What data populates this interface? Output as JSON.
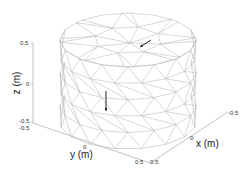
{
  "chart_data": {
    "type": "3d-mesh",
    "title": "",
    "xlabel": "x (m)",
    "ylabel": "y (m)",
    "zlabel": "z (m)",
    "xlim": [
      -0.5,
      0.5
    ],
    "ylim": [
      -0.5,
      0.5
    ],
    "zlim": [
      -0.5,
      0.5
    ],
    "xticks": [
      "0.5",
      "0",
      "-0.5"
    ],
    "yticks": [
      "-0.5",
      "0",
      "0.5"
    ],
    "zticks": [
      "0.5",
      "0",
      "-0.5"
    ],
    "grid": false,
    "legend": null,
    "mesh": {
      "shape": "cylinder",
      "radius": 0.5,
      "z_range": [
        -0.5,
        0.5
      ],
      "angular_divisions": 16,
      "height_divisions": 5,
      "edge_color": "#b8b8b8",
      "face_color": "#ffffff"
    },
    "arrows": [
      {
        "location": "top-face",
        "direction": "down-left (in-plane)",
        "color": "#222222"
      },
      {
        "location": "side-face",
        "direction": "down (-z)",
        "color": "#222222"
      }
    ]
  },
  "axes": {
    "x": {
      "label": "x (m)",
      "ticks": [
        {
          "text": "0.5"
        },
        {
          "text": "0"
        },
        {
          "text": "-0.5"
        }
      ]
    },
    "y": {
      "label": "y (m)",
      "ticks": [
        {
          "text": "-0.5"
        },
        {
          "text": "0"
        },
        {
          "text": "0.5"
        }
      ]
    },
    "z": {
      "label": "z (m)",
      "ticks": [
        {
          "text": "0.5"
        },
        {
          "text": "0"
        },
        {
          "text": "-0.5"
        }
      ]
    }
  },
  "colors": {
    "mesh_edge": "#b8b8b8",
    "axis_line": "#9a9a9a",
    "arrow": "#222222",
    "background": "#ffffff"
  }
}
